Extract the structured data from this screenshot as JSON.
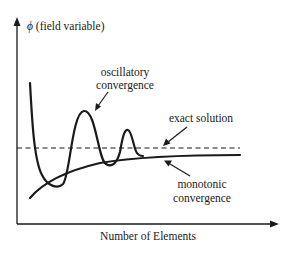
{
  "diagram": {
    "y_axis": {
      "symbol": "ϕ",
      "label": "(field variable)"
    },
    "x_axis": {
      "label": "Number of Elements"
    },
    "annotations": {
      "oscillatory": {
        "line1": "oscillatory",
        "line2": "convergence"
      },
      "exact": {
        "text": "exact solution"
      },
      "monotonic": {
        "line1": "monotonic",
        "line2": "convergence"
      }
    },
    "curves": [
      {
        "name": "exact solution",
        "style": "dashed",
        "description": "horizontal asymptote"
      },
      {
        "name": "oscillatory convergence",
        "style": "solid",
        "description": "overshoots and undershoots, damping toward exact solution"
      },
      {
        "name": "monotonic convergence",
        "style": "solid",
        "description": "rises steadily from below toward exact solution"
      }
    ],
    "colors": {
      "ink": "#1a1a1a",
      "background": "#ffffff"
    }
  }
}
